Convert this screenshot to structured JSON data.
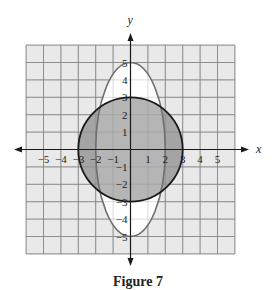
{
  "figure": {
    "caption": "Figure 7"
  },
  "chart_data": {
    "type": "line",
    "title": "Figure 7",
    "xlabel": "x",
    "ylabel": "y",
    "xlim": [
      -6,
      6
    ],
    "ylim": [
      -6,
      6
    ],
    "grid": true,
    "x_ticks": [
      -5,
      -4,
      -3,
      -2,
      -1,
      1,
      2,
      3,
      4,
      5
    ],
    "y_ticks": [
      -5,
      -4,
      -3,
      -2,
      -1,
      1,
      2,
      3,
      4,
      5
    ],
    "series": [
      {
        "name": "circle",
        "equation": "x^2 + y^2 = 9",
        "center": [
          0,
          0
        ],
        "radius": 3,
        "fill": "shaded",
        "stroke": "#1a1a1a"
      },
      {
        "name": "ellipse",
        "equation": "x^2/4 + y^2/25 = 1",
        "center": [
          0,
          0
        ],
        "semi_axis_x": 2,
        "semi_axis_y": 5,
        "fill": "white-outside-circle",
        "stroke": "#6e6e6e"
      }
    ],
    "regions": [
      {
        "name": "circle-outside-ellipse",
        "color": "#9d9d9d"
      },
      {
        "name": "circle-inside-ellipse",
        "color": "#b5b5b5"
      },
      {
        "name": "ellipse-outside-circle",
        "color": "#ffffff"
      }
    ]
  },
  "colors": {
    "grid_bg": "#e9e9e9",
    "grid_line": "#8c8c8c",
    "axis": "#1a1a1a"
  }
}
